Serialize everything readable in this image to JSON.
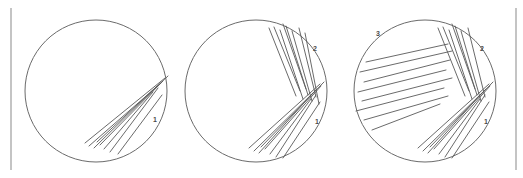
{
  "figure": {
    "background_color": "#ffffff",
    "outline_color": "#6b6b6b",
    "streak_color": "#595959",
    "label_color": "#4a4a4a",
    "rule_color": "#c4c4c4"
  },
  "rules": [
    {
      "name": "left-rule",
      "x": 11,
      "y1": 8,
      "y2": 170
    },
    {
      "name": "right-rule",
      "x": 516,
      "y1": 8,
      "y2": 170
    }
  ],
  "plates": [
    {
      "id": "plate-1",
      "name": "first-streak-plate",
      "center_x": 96,
      "center_y": 91,
      "radius": 71,
      "labels": [
        {
          "text": "1",
          "x": 155,
          "y": 122
        }
      ],
      "zones": [
        {
          "id": "zone-1",
          "name": "primary-streak-zone",
          "streaks": [
            [
              85,
              143,
              165,
              78
            ],
            [
              89,
              146,
              161,
              83
            ],
            [
              94,
              148,
              157,
              86
            ],
            [
              100,
              145,
              163,
              81
            ],
            [
              104,
              149,
              153,
              92
            ],
            [
              110,
              152,
              158,
              88
            ],
            [
              118,
              154,
              162,
              95
            ],
            [
              97,
              142,
              168,
              76
            ]
          ]
        }
      ]
    },
    {
      "id": "plate-2",
      "name": "second-streak-plate",
      "center_x": 256,
      "center_y": 91,
      "radius": 71,
      "labels": [
        {
          "text": "1",
          "x": 317,
          "y": 124
        },
        {
          "text": "2",
          "x": 315,
          "y": 51
        }
      ],
      "zones": [
        {
          "id": "zone-1",
          "name": "primary-streak-zone",
          "streaks": [
            [
              249,
              148,
              320,
              84
            ],
            [
              254,
              151,
              317,
              89
            ],
            [
              259,
              153,
              313,
              93
            ],
            [
              265,
              149,
              321,
              86
            ],
            [
              270,
              154,
              311,
              99
            ],
            [
              276,
              157,
              316,
              95
            ],
            [
              283,
              158,
              320,
              102
            ],
            [
              261,
              147,
              324,
              82
            ]
          ]
        },
        {
          "id": "zone-2",
          "name": "secondary-streak-zone",
          "streaks": [
            [
              269,
              28,
              296,
              96
            ],
            [
              274,
              27,
              300,
              91
            ],
            [
              280,
              30,
              303,
              99
            ],
            [
              286,
              26,
              308,
              95
            ],
            [
              292,
              31,
              312,
              101
            ],
            [
              299,
              28,
              316,
              97
            ],
            [
              305,
              33,
              319,
              104
            ],
            [
              283,
              24,
              306,
              89
            ]
          ]
        }
      ]
    },
    {
      "id": "plate-3",
      "name": "third-streak-plate",
      "center_x": 425,
      "center_y": 91,
      "radius": 71,
      "labels": [
        {
          "text": "1",
          "x": 486,
          "y": 124
        },
        {
          "text": "2",
          "x": 482,
          "y": 51
        },
        {
          "text": "3",
          "x": 378,
          "y": 36
        }
      ],
      "zones": [
        {
          "id": "zone-1",
          "name": "primary-streak-zone",
          "streaks": [
            [
              418,
              148,
              489,
              84
            ],
            [
              423,
              151,
              486,
              89
            ],
            [
              428,
              153,
              482,
              93
            ],
            [
              434,
              149,
              490,
              86
            ],
            [
              439,
              154,
              480,
              99
            ],
            [
              445,
              157,
              485,
              95
            ],
            [
              452,
              158,
              489,
              102
            ],
            [
              430,
              147,
              493,
              82
            ]
          ]
        },
        {
          "id": "zone-2",
          "name": "secondary-streak-zone",
          "streaks": [
            [
              438,
              28,
              465,
              96
            ],
            [
              443,
              27,
              469,
              91
            ],
            [
              449,
              30,
              472,
              99
            ],
            [
              455,
              26,
              477,
              95
            ],
            [
              461,
              31,
              481,
              101
            ],
            [
              468,
              28,
              485,
              97
            ],
            [
              452,
              24,
              475,
              89
            ]
          ]
        },
        {
          "id": "zone-3",
          "name": "tertiary-streak-zone",
          "streaks": [
            [
              366,
              62,
              448,
              44
            ],
            [
              360,
              72,
              452,
              51
            ],
            [
              364,
              82,
              450,
              60
            ],
            [
              358,
              92,
              446,
              70
            ],
            [
              362,
              101,
              452,
              78
            ],
            [
              356,
              111,
              444,
              88
            ],
            [
              364,
              120,
              448,
              96
            ],
            [
              372,
              130,
              440,
              104
            ]
          ]
        }
      ]
    }
  ]
}
